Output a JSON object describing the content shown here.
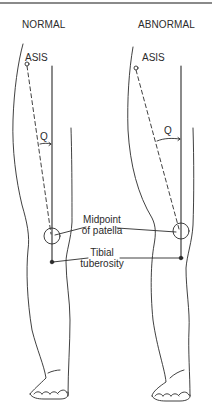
{
  "figure": {
    "panels": [
      {
        "title": "NORMAL",
        "landmark_top": "ASIS",
        "angle_label": "Q"
      },
      {
        "title": "ABNORMAL",
        "landmark_top": "ASIS",
        "angle_label": "Q"
      }
    ],
    "callouts": {
      "patella_line1": "Midpoint",
      "patella_line2": "of patella",
      "tibial_line1": "Tibial",
      "tibial_line2": "tuberosity"
    },
    "colors": {
      "ink": "#2b2b2b",
      "rule": "#8a8a8a",
      "background": "#ffffff"
    }
  }
}
